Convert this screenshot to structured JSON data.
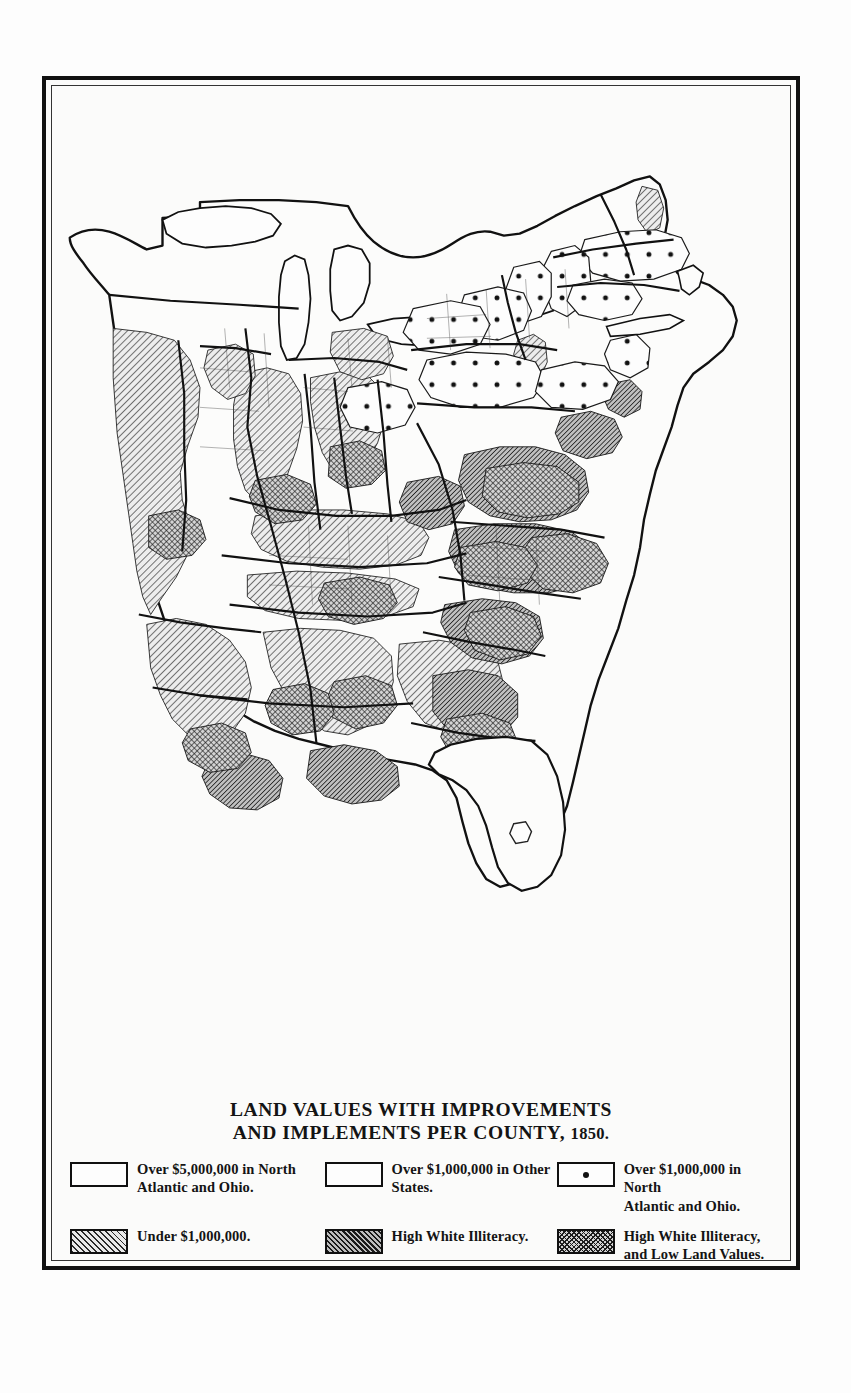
{
  "plate": {
    "title_line1": "LAND VALUES WITH IMPROVEMENTS",
    "title_line2a": "AND IMPLEMENTS PER COUNTY,",
    "title_year": "1850."
  },
  "legend": {
    "rows": [
      {
        "cells": [
          {
            "pattern": "blank",
            "swatch_name": "legend-swatch-blank-north-atlantic-ohio",
            "label": "Over $5,000,000 in North\nAtlantic and Ohio."
          },
          {
            "pattern": "blank",
            "swatch_name": "legend-swatch-blank-other-states",
            "label": "Over $1,000,000 in Other\nStates."
          },
          {
            "pattern": "dot",
            "swatch_name": "legend-swatch-dotted-north-atlantic-ohio",
            "label": "Over $1,000,000 in North\nAtlantic and Ohio."
          }
        ]
      },
      {
        "cells": [
          {
            "pattern": "hatch-light",
            "swatch_name": "legend-swatch-hatch-under-one-million",
            "label": "Under $1,000,000."
          },
          {
            "pattern": "hatch-dark",
            "swatch_name": "legend-swatch-dense-high-illiteracy",
            "label": "High White Illiteracy."
          },
          {
            "pattern": "cross",
            "swatch_name": "legend-swatch-cross-illiteracy-low-land",
            "label": "High White Illiteracy,\nand Low Land Values."
          }
        ]
      }
    ]
  },
  "map_data": {
    "type": "choropleth-county-map",
    "region": "Eastern United States",
    "year": 1850,
    "variable": "Land values with improvements and implements per county",
    "categories": [
      "Over $5,000,000 in North Atlantic and Ohio.",
      "Over $1,000,000 in Other States.",
      "Over $1,000,000 in North Atlantic and Ohio.",
      "Under $1,000,000.",
      "High White Illiteracy.",
      "High White Illiteracy, and Low Land Values."
    ],
    "pattern_by_category": {
      "Over $5,000,000 in North Atlantic and Ohio.": "blank",
      "Over $1,000,000 in Other States.": "blank",
      "Over $1,000,000 in North Atlantic and Ohio.": "dot",
      "Under $1,000,000.": "hatch-light",
      "High White Illiteracy.": "hatch-dark",
      "High White Illiteracy, and Low Land Values.": "cross"
    },
    "region_notes": [
      {
        "area": "New England (Massachusetts, Connecticut, Rhode Island, New Hampshire, Vermont, southern Maine)",
        "pattern": "dot"
      },
      {
        "area": "New York (central and western counties)",
        "pattern": "dot"
      },
      {
        "area": "Pennsylvania (eastern and central counties)",
        "pattern": "dot"
      },
      {
        "area": "Ohio, Indiana, Illinois (scattered counties)",
        "pattern": "hatch-light"
      },
      {
        "area": "Virginia, North Carolina, South Carolina, Georgia piedmont and coastal plain",
        "pattern": "cross"
      },
      {
        "area": "Kentucky, Tennessee uplands",
        "pattern": "hatch-light"
      },
      {
        "area": "Alabama, Mississippi, Louisiana, Arkansas, Missouri",
        "pattern": "hatch-light"
      },
      {
        "area": "Florida peninsula",
        "pattern": "blank"
      }
    ]
  }
}
